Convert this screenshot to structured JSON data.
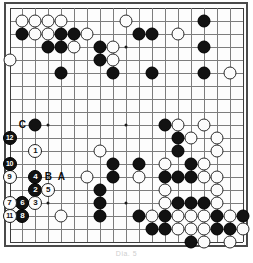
{
  "figure": {
    "kind": "go-board-diagram",
    "board_size": 19,
    "caption": "Dia. 5",
    "colors": {
      "black_stone": "#121212",
      "white_stone": "#fcfcfc",
      "grid_line": "#7d7d7d",
      "border": "#4a4a4a",
      "board_background": "#fdfdfd",
      "label_text": "#0a0a0a"
    }
  },
  "board": {
    "star_points": [
      {
        "col": 4,
        "row": 4
      },
      {
        "col": 10,
        "row": 4
      },
      {
        "col": 16,
        "row": 4
      },
      {
        "col": 4,
        "row": 10
      },
      {
        "col": 10,
        "row": 10
      },
      {
        "col": 16,
        "row": 10
      },
      {
        "col": 4,
        "row": 16
      },
      {
        "col": 10,
        "row": 16
      },
      {
        "col": 16,
        "row": 16
      }
    ],
    "black_stones": [
      {
        "col": 2,
        "row": 3
      },
      {
        "col": 5,
        "row": 3
      },
      {
        "col": 6,
        "row": 3
      },
      {
        "col": 11,
        "row": 3
      },
      {
        "col": 12,
        "row": 3
      },
      {
        "col": 16,
        "row": 2
      },
      {
        "col": 4,
        "row": 4
      },
      {
        "col": 5,
        "row": 4
      },
      {
        "col": 8,
        "row": 4
      },
      {
        "col": 16,
        "row": 4
      },
      {
        "col": 8,
        "row": 5
      },
      {
        "col": 5,
        "row": 6
      },
      {
        "col": 9,
        "row": 6
      },
      {
        "col": 12,
        "row": 6
      },
      {
        "col": 16,
        "row": 6
      },
      {
        "col": 3,
        "row": 10
      },
      {
        "col": 13,
        "row": 10
      },
      {
        "col": 14,
        "row": 11
      },
      {
        "col": 14,
        "row": 12
      },
      {
        "col": 9,
        "row": 13
      },
      {
        "col": 11,
        "row": 13
      },
      {
        "col": 15,
        "row": 13
      },
      {
        "col": 9,
        "row": 14
      },
      {
        "col": 13,
        "row": 14
      },
      {
        "col": 14,
        "row": 14
      },
      {
        "col": 15,
        "row": 14
      },
      {
        "col": 8,
        "row": 15
      },
      {
        "col": 14,
        "row": 16
      },
      {
        "col": 15,
        "row": 16
      },
      {
        "col": 16,
        "row": 16
      },
      {
        "col": 8,
        "row": 16
      },
      {
        "col": 1,
        "row": 17
      },
      {
        "col": 8,
        "row": 17
      },
      {
        "col": 11,
        "row": 17
      },
      {
        "col": 13,
        "row": 17
      },
      {
        "col": 17,
        "row": 17
      },
      {
        "col": 19,
        "row": 17
      },
      {
        "col": 12,
        "row": 18
      },
      {
        "col": 13,
        "row": 18
      },
      {
        "col": 17,
        "row": 18
      },
      {
        "col": 18,
        "row": 18
      },
      {
        "col": 15,
        "row": 19
      }
    ],
    "white_stones": [
      {
        "col": 2,
        "row": 2
      },
      {
        "col": 3,
        "row": 2
      },
      {
        "col": 4,
        "row": 2
      },
      {
        "col": 5,
        "row": 2
      },
      {
        "col": 10,
        "row": 2
      },
      {
        "col": 3,
        "row": 3
      },
      {
        "col": 4,
        "row": 3
      },
      {
        "col": 7,
        "row": 3
      },
      {
        "col": 14,
        "row": 3
      },
      {
        "col": 6,
        "row": 4
      },
      {
        "col": 9,
        "row": 4
      },
      {
        "col": 1,
        "row": 5
      },
      {
        "col": 9,
        "row": 5
      },
      {
        "col": 18,
        "row": 6
      },
      {
        "col": 14,
        "row": 10
      },
      {
        "col": 16,
        "row": 10
      },
      {
        "col": 15,
        "row": 11
      },
      {
        "col": 17,
        "row": 11
      },
      {
        "col": 17,
        "row": 12
      },
      {
        "col": 8,
        "row": 12
      },
      {
        "col": 13,
        "row": 13
      },
      {
        "col": 16,
        "row": 13
      },
      {
        "col": 1,
        "row": 14
      },
      {
        "col": 7,
        "row": 14
      },
      {
        "col": 11,
        "row": 14
      },
      {
        "col": 16,
        "row": 14
      },
      {
        "col": 17,
        "row": 14
      },
      {
        "col": 13,
        "row": 15
      },
      {
        "col": 17,
        "row": 15
      },
      {
        "col": 2,
        "row": 16
      },
      {
        "col": 13,
        "row": 16
      },
      {
        "col": 17,
        "row": 16
      },
      {
        "col": 12,
        "row": 17
      },
      {
        "col": 14,
        "row": 17
      },
      {
        "col": 15,
        "row": 17
      },
      {
        "col": 16,
        "row": 17
      },
      {
        "col": 18,
        "row": 17
      },
      {
        "col": 5,
        "row": 17
      },
      {
        "col": 14,
        "row": 18
      },
      {
        "col": 15,
        "row": 18
      },
      {
        "col": 16,
        "row": 18
      },
      {
        "col": 19,
        "row": 18
      },
      {
        "col": 16,
        "row": 19
      },
      {
        "col": 18,
        "row": 19
      }
    ],
    "numbered_moves": [
      {
        "label": "1",
        "color": "white",
        "col": 3,
        "row": 12
      },
      {
        "label": "2",
        "color": "black",
        "col": 3,
        "row": 15
      },
      {
        "label": "3",
        "color": "white",
        "col": 3,
        "row": 16
      },
      {
        "label": "4",
        "color": "black",
        "col": 3,
        "row": 14
      },
      {
        "label": "5",
        "color": "white",
        "col": 4,
        "row": 15
      },
      {
        "label": "6",
        "color": "black",
        "col": 2,
        "row": 16
      },
      {
        "label": "7",
        "color": "white",
        "col": 1,
        "row": 16
      },
      {
        "label": "8",
        "color": "black",
        "col": 2,
        "row": 17
      },
      {
        "label": "9",
        "color": "white",
        "col": 1,
        "row": 14
      },
      {
        "label": "10",
        "color": "black",
        "col": 1,
        "row": 13
      },
      {
        "label": "11",
        "color": "white",
        "col": 1,
        "row": 17
      },
      {
        "label": "12",
        "color": "black",
        "col": 1,
        "row": 11
      }
    ],
    "letter_marks": [
      {
        "label": "A",
        "col": 5,
        "row": 14
      },
      {
        "label": "B",
        "col": 4,
        "row": 14
      },
      {
        "label": "C",
        "col": 2,
        "row": 10
      }
    ]
  }
}
